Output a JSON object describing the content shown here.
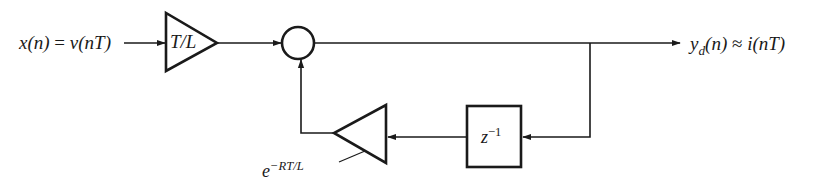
{
  "diagram": {
    "type": "block-diagram",
    "colors": {
      "stroke": "#1a1a1a",
      "background": "#ffffff"
    },
    "input": {
      "label_lhs": "x(n)",
      "equals": "=",
      "label_rhs": "v(nT)"
    },
    "gain_forward": {
      "label": "T/L"
    },
    "summing_junction": {
      "symbol": ""
    },
    "output": {
      "y": "y",
      "sub": "d",
      "args": "(n)",
      "approx": "≈",
      "rhs": "i(nT)"
    },
    "delay": {
      "base": "z",
      "exponent": "−1"
    },
    "gain_feedback": {
      "base": "e",
      "exponent": "−RT/L"
    },
    "edges": [
      {
        "from": "input",
        "to": "gain_forward"
      },
      {
        "from": "gain_forward",
        "to": "summing_junction"
      },
      {
        "from": "summing_junction",
        "to": "output"
      },
      {
        "from": "output_branch",
        "to": "delay"
      },
      {
        "from": "delay",
        "to": "gain_feedback"
      },
      {
        "from": "gain_feedback",
        "to": "summing_junction"
      }
    ]
  }
}
